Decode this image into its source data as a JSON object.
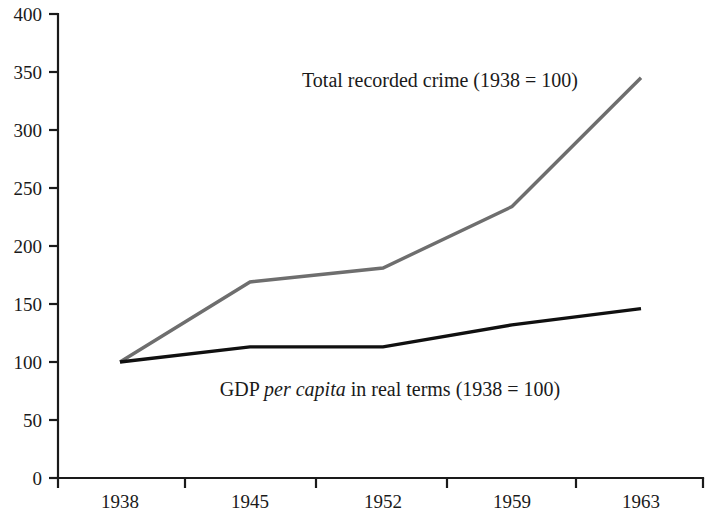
{
  "chart_data": {
    "type": "line",
    "title": "",
    "xlabel": "",
    "ylabel": "",
    "categories": [
      "1938",
      "1945",
      "1952",
      "1959",
      "1963"
    ],
    "ylim": [
      0,
      400
    ],
    "yticks": [
      0,
      50,
      100,
      150,
      200,
      250,
      300,
      350,
      400
    ],
    "ytick_labels": [
      "0",
      "50",
      "100",
      "150",
      "200",
      "250",
      "300",
      "350",
      "400"
    ],
    "grid": false,
    "legend": "inline annotations",
    "series": [
      {
        "name": "Total recorded crime (1938 = 100)",
        "color": "#6e6e6e",
        "values": [
          100,
          169,
          181,
          234,
          345
        ]
      },
      {
        "name": "GDP per capita in real terms (1938 = 100)",
        "color": "#101010",
        "values": [
          100,
          113,
          113,
          132,
          146
        ]
      }
    ],
    "annotations": [
      {
        "id": "crime-annotation",
        "text": "Total recorded crime (1938 = 100)",
        "text_plain": "Total recorded crime (1938 = 100)",
        "italic_part": "",
        "x": 440,
        "y": 87
      },
      {
        "id": "gdp-annotation",
        "text_before": "GDP ",
        "text_italic": "per capita",
        "text_after": " in real terms (1938 = 100)",
        "text_plain": "GDP per capita in real terms (1938 = 100)",
        "x": 390,
        "y": 396
      }
    ]
  },
  "axes": {
    "y_axis_name": "y-axis",
    "x_axis_name": "x-axis",
    "plot_left": 58,
    "plot_right": 703,
    "plot_top": 14,
    "plot_bottom": 478,
    "category_x": [
      120,
      250,
      383,
      512,
      641
    ],
    "x_tick_positions": [
      58,
      185,
      316,
      447,
      576,
      703
    ]
  },
  "colors": {
    "crime_line": "#6e6e6e",
    "gdp_line": "#101010",
    "axis": "#1a1a1a",
    "background": "#ffffff",
    "text": "#1a1a1a"
  }
}
